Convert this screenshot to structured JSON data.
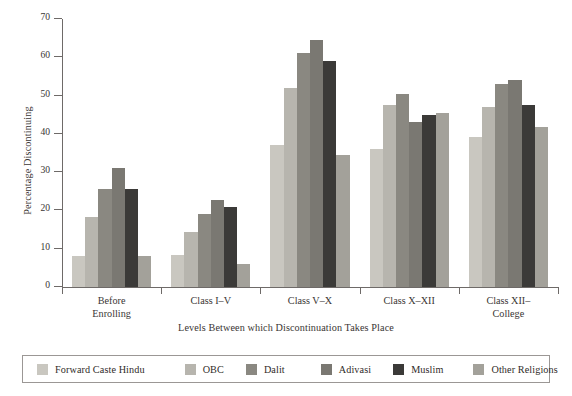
{
  "chart_data": {
    "type": "bar",
    "title": "",
    "subtitle": "",
    "xlabel": "Levels Between which Discontinuation Takes Place",
    "ylabel": "Percentage Discontinuing",
    "categories": [
      "Before\nEnrolling",
      "Class I–V",
      "Class V–X",
      "Class X–XII",
      "Class XII–\nCollege"
    ],
    "category_labels": [
      [
        "Before",
        "Enrolling"
      ],
      [
        "Class I–V"
      ],
      [
        "Class V–X"
      ],
      [
        "Class X–XII"
      ],
      [
        "Class XII–",
        "College"
      ]
    ],
    "series": [
      {
        "name": "Forward Caste Hindu",
        "color": "#c9c7c0",
        "values": [
          8.0,
          8.3,
          37.0,
          36.0,
          39.3
        ]
      },
      {
        "name": "OBC",
        "color": "#b7b5ae",
        "values": [
          18.3,
          14.3,
          52.0,
          47.5,
          47.0
        ]
      },
      {
        "name": "Dalit",
        "color": "#8a8881",
        "values": [
          25.7,
          19.0,
          61.0,
          50.5,
          53.0
        ]
      },
      {
        "name": "Adivasi",
        "color": "#7a7872",
        "values": [
          31.0,
          22.7,
          64.5,
          43.0,
          54.0
        ]
      },
      {
        "name": "Muslim",
        "color": "#3b3a38",
        "values": [
          25.5,
          21.0,
          59.0,
          45.0,
          47.5
        ]
      },
      {
        "name": "Other Religions",
        "color": "#a3a19a",
        "values": [
          8.0,
          6.0,
          34.5,
          45.5,
          41.7
        ]
      }
    ],
    "yticks": [
      0,
      10,
      20,
      30,
      40,
      50,
      60,
      70
    ],
    "ylim": [
      0,
      70
    ],
    "grid": false,
    "legend_position": "bottom"
  },
  "legend": {
    "items": [
      {
        "label": "Forward Caste Hindu"
      },
      {
        "label": "OBC"
      },
      {
        "label": "Dalit"
      },
      {
        "label": "Adivasi"
      },
      {
        "label": "Muslim"
      },
      {
        "label": "Other Religions"
      }
    ]
  }
}
